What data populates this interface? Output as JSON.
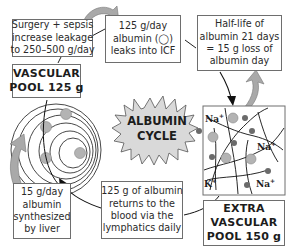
{
  "diagram": {
    "title": "Albumin cycle",
    "center_label": [
      "ALBUMIN",
      "CYCLE"
    ],
    "boxes": {
      "surgery_sepsis": [
        "Surgery + sepsis",
        "increase leakage",
        "to 250–500 g/day"
      ],
      "vascular_pool": [
        "VASCULAR",
        "POOL 125 g"
      ],
      "leak_icf": [
        "125 g/day",
        "albumin (◯)",
        "leaks into ICF"
      ],
      "half_life": [
        "Half-life of",
        "albumin 21 days",
        "= 15 g loss of",
        "albumin day"
      ],
      "extravascular_pool": [
        "EXTRA",
        "VASCULAR",
        "POOL 150 g"
      ],
      "lymphatics": [
        "125 g of albumin",
        "returns to the",
        "blood via the",
        "lymphatics daily"
      ],
      "liver": [
        "15 g/day",
        "albumin",
        "synthesized",
        "by liver"
      ]
    },
    "ions": [
      {
        "label": "Na",
        "charge": "+"
      },
      {
        "label": "Na",
        "charge": "+"
      },
      {
        "label": "Na",
        "charge": "+"
      },
      {
        "label": "K",
        "charge": "+"
      }
    ],
    "colors": {
      "arrow_fill": "#a9a9a9",
      "star_fill": "#d9d9d9",
      "albumin_dot": "#b3b3b3",
      "small_dot": "#6b6b6b",
      "box_border": "#6e6e6e"
    }
  }
}
